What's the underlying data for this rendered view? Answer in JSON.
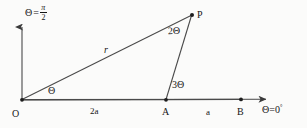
{
  "figure": {
    "kind": "polar-geometry-diagram",
    "background_color": "#fbfbfa",
    "stroke_color": "#3a3a3a",
    "text_color": "#161616"
  },
  "labels": {
    "axis_vertical": {
      "symbol": "Θ",
      "equals": "=",
      "numerator": "π",
      "denominator": "2",
      "full": "Θ = π/2"
    },
    "axis_horizontal": {
      "symbol": "Θ",
      "equals": "=",
      "value": "0",
      "degree": "°",
      "full": "Θ = 0°"
    },
    "point_o": "O",
    "point_a": "A",
    "point_b": "B",
    "point_p": "P",
    "angle_at_o": "Θ",
    "angle_at_p": "2Θ",
    "angle_at_a": "3Θ",
    "radius": "r",
    "segment_oa": "2a",
    "segment_ab": "a"
  },
  "geometry": {
    "points": {
      "O": {
        "x": 22,
        "y": 100
      },
      "A": {
        "x": 166,
        "y": 100
      },
      "B": {
        "x": 241,
        "y": 99
      },
      "P": {
        "x": 192,
        "y": 15
      }
    },
    "axis_vertical_tip": {
      "x": 22,
      "y": 24
    },
    "axis_horizontal_tip": {
      "x": 272,
      "y": 99
    }
  }
}
